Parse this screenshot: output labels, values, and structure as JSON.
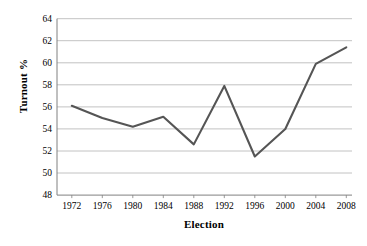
{
  "chart_data": {
    "type": "line",
    "title": "",
    "xlabel": "Election",
    "ylabel": "Turnout %",
    "categories": [
      "1972",
      "1976",
      "1980",
      "1984",
      "1988",
      "1992",
      "1996",
      "2000",
      "2004",
      "2008"
    ],
    "values": [
      56.1,
      55.0,
      54.2,
      55.1,
      52.6,
      57.9,
      51.5,
      54.0,
      59.9,
      61.4
    ],
    "series": [
      {
        "name": "Turnout %",
        "values": [
          56.1,
          55.0,
          54.2,
          55.1,
          52.6,
          57.9,
          51.5,
          54.0,
          59.9,
          61.4
        ]
      }
    ],
    "ylim": [
      48,
      64
    ],
    "yticks": [
      48,
      50,
      52,
      54,
      56,
      58,
      60,
      62,
      64
    ],
    "ytick_labels": [
      "48",
      "50",
      "52",
      "54",
      "56",
      "58",
      "60",
      "62",
      "64"
    ],
    "xtick_labels": [
      "1972",
      "1976",
      "1980",
      "1984",
      "1988",
      "1992",
      "1996",
      "2000",
      "2004",
      "2008"
    ],
    "grid": "horizontal",
    "legend": "none",
    "line_color": "#555555",
    "grid_color": "#b3b3b3",
    "axis_color": "#808080",
    "background_color": "#ffffff"
  }
}
